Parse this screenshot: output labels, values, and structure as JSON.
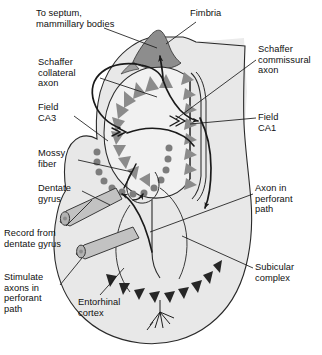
{
  "figure": {
    "type": "anatomical-diagram"
  },
  "colors": {
    "background": "#ffffff",
    "stroke": "#1a1a1a",
    "hippocampus_fill": "#e9e9e9",
    "cortex_fill": "#e3e3e3",
    "band_fill": "#ebebeb",
    "fimbria_fill": "#8f8f8f",
    "pyramidal_cell": "#8a8a8a",
    "granule_cell": "#7e7e7e",
    "entorhinal_cell": "#2a2a2a",
    "electrode_fill": "#c4c4c4",
    "text": "#101010"
  },
  "labels": [
    {
      "id": "to-septum",
      "text": "To septum,\nmammillary bodies",
      "x": 36,
      "y": 8,
      "align": "left"
    },
    {
      "id": "fimbria",
      "text": "Fimbria",
      "x": 190,
      "y": 8,
      "align": "left"
    },
    {
      "id": "schaffer-collateral",
      "text": "Schaffer\ncollateral\naxon",
      "x": 38,
      "y": 57,
      "align": "left"
    },
    {
      "id": "schaffer-commissural",
      "text": "Schaffer\ncommissural\naxon",
      "x": 258,
      "y": 44,
      "align": "left"
    },
    {
      "id": "field-ca3",
      "text": "Field\nCA3",
      "x": 38,
      "y": 102,
      "align": "left"
    },
    {
      "id": "field-ca1",
      "text": "Field\nCA1",
      "x": 258,
      "y": 112,
      "align": "left"
    },
    {
      "id": "mossy-fiber",
      "text": "Mossy\nfiber",
      "x": 38,
      "y": 148,
      "align": "left"
    },
    {
      "id": "dentate-gyrus",
      "text": "Dentate\ngyrus",
      "x": 38,
      "y": 183,
      "align": "left"
    },
    {
      "id": "axon-perforant",
      "text": "Axon in\nperforant\npath",
      "x": 255,
      "y": 183,
      "align": "left"
    },
    {
      "id": "record-dentate",
      "text": "Record from\ndentate gyrus",
      "x": 4,
      "y": 228,
      "align": "left"
    },
    {
      "id": "subicular-complex",
      "text": "Subicular\ncomplex",
      "x": 255,
      "y": 262,
      "align": "left"
    },
    {
      "id": "stimulate-axons",
      "text": "Stimulate\naxons in\nperforant\npath",
      "x": 4,
      "y": 272,
      "align": "left"
    },
    {
      "id": "entorhinal-cortex",
      "text": "Entorhinal\ncortex",
      "x": 78,
      "y": 297,
      "align": "left"
    }
  ],
  "structures": [
    {
      "id": "fimbria",
      "name": "Fimbria"
    },
    {
      "id": "field-ca3",
      "name": "Field CA3"
    },
    {
      "id": "field-ca1",
      "name": "Field CA1"
    },
    {
      "id": "dentate-gyrus",
      "name": "Dentate gyrus"
    },
    {
      "id": "subicular-complex",
      "name": "Subicular complex"
    },
    {
      "id": "entorhinal-cortex",
      "name": "Entorhinal cortex"
    }
  ],
  "pathways": [
    {
      "id": "schaffer-collateral-axon",
      "name": "Schaffer collateral axon"
    },
    {
      "id": "schaffer-commissural-axon",
      "name": "Schaffer commissural axon"
    },
    {
      "id": "mossy-fiber",
      "name": "Mossy fiber"
    },
    {
      "id": "perforant-path-axon",
      "name": "Axon in perforant path"
    },
    {
      "id": "to-septum-mammillary-bodies",
      "name": "To septum, mammillary bodies"
    }
  ],
  "electrodes": [
    {
      "id": "record-electrode",
      "name": "Record from dentate gyrus"
    },
    {
      "id": "stimulate-electrode",
      "name": "Stimulate axons in perforant path"
    }
  ]
}
